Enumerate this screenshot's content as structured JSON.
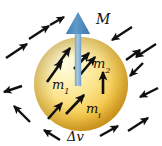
{
  "figure": {
    "background_color": "#ffffff",
    "width": 162,
    "height": 146
  },
  "sphere": {
    "name": "volume-element-sphere",
    "label": "Δv",
    "label_text": "Δv",
    "center_x": 81,
    "center_y": 84,
    "radius": 47,
    "highlight_color": "#fdf6cf",
    "mid_color": "#fbe07a",
    "edge_color": "#e8a52c",
    "shadow_color": "#c98a18"
  },
  "net_moment_arrow": {
    "name": "net-magnetization-arrow",
    "label": "M",
    "color_shaft": "#8fb6d4",
    "color_head": "#4a86b8",
    "tail_x": 78,
    "tail_y": 86,
    "tip_x": 78,
    "tip_y": 12,
    "label_x": 96,
    "label_y": 24
  },
  "internal_moments": [
    {
      "name": "moment-m1",
      "label": "m",
      "subscript": "1",
      "angle_deg": -55,
      "x1": 47,
      "y1": 82,
      "x2": 62,
      "y2": 61,
      "label_x": 52,
      "label_y": 89
    },
    {
      "name": "moment-m2",
      "label": "m",
      "subscript": "2",
      "angle_deg": -50,
      "x1": 79,
      "y1": 76,
      "x2": 95,
      "y2": 57,
      "label_x": 93,
      "label_y": 68
    },
    {
      "name": "moment-mi",
      "label": "m",
      "subscript": "i",
      "angle_deg": -50,
      "x1": 66,
      "y1": 114,
      "x2": 84,
      "y2": 95,
      "label_x": 86,
      "label_y": 113
    },
    {
      "name": "moment-vertical-right",
      "label": "",
      "subscript": "",
      "angle_deg": -90,
      "x1": 103,
      "y1": 94,
      "x2": 103,
      "y2": 72,
      "label_x": 0,
      "label_y": 0
    },
    {
      "name": "moment-upper-left-inner",
      "label": "",
      "subscript": "",
      "angle_deg": -58,
      "x1": 58,
      "y1": 64,
      "x2": 70,
      "y2": 48,
      "label_x": 0,
      "label_y": 0
    },
    {
      "name": "moment-upper-center",
      "label": "",
      "subscript": "",
      "angle_deg": -50,
      "x1": 74,
      "y1": 69,
      "x2": 89,
      "y2": 53,
      "label_x": 0,
      "label_y": 0
    },
    {
      "name": "moment-lower-left",
      "label": "",
      "subscript": "",
      "angle_deg": -58,
      "x1": 48,
      "y1": 119,
      "x2": 62,
      "y2": 103,
      "label_x": 0,
      "label_y": 0
    }
  ],
  "external_arrows": [
    {
      "name": "field-arrow-nw-outer",
      "x1": 6,
      "y1": 58,
      "x2": 27,
      "y2": 44
    },
    {
      "name": "field-arrow-nw-inner",
      "x1": 29,
      "y1": 39,
      "x2": 49,
      "y2": 26
    },
    {
      "name": "field-arrow-n",
      "x1": 50,
      "y1": 25,
      "x2": 64,
      "y2": 17
    },
    {
      "name": "field-arrow-ne-inner",
      "x1": 132,
      "y1": 27,
      "x2": 112,
      "y2": 40
    },
    {
      "name": "field-arrow-ne-outer",
      "x1": 156,
      "y1": 44,
      "x2": 136,
      "y2": 57
    },
    {
      "name": "field-arrow-e-upper",
      "x1": 143,
      "y1": 63,
      "x2": 130,
      "y2": 76
    },
    {
      "name": "field-arrow-e-lower",
      "x1": 158,
      "y1": 88,
      "x2": 140,
      "y2": 97
    },
    {
      "name": "field-arrow-se-outer",
      "x1": 128,
      "y1": 131,
      "x2": 148,
      "y2": 118
    },
    {
      "name": "field-arrow-se-inner",
      "x1": 100,
      "y1": 136,
      "x2": 118,
      "y2": 126
    },
    {
      "name": "field-arrow-s",
      "x1": 60,
      "y1": 140,
      "x2": 44,
      "y2": 130
    },
    {
      "name": "field-arrow-sw-outer",
      "x1": 30,
      "y1": 122,
      "x2": 14,
      "y2": 106
    },
    {
      "name": "field-arrow-w",
      "x1": 22,
      "y1": 86,
      "x2": 4,
      "y2": 92
    },
    {
      "name": "field-arrow-ne-top",
      "x1": 126,
      "y1": 60,
      "x2": 140,
      "y2": 50
    }
  ],
  "arrow_style": {
    "stroke_color": "#101010",
    "stroke_width": 2.6,
    "external_stroke_width": 2.4
  }
}
